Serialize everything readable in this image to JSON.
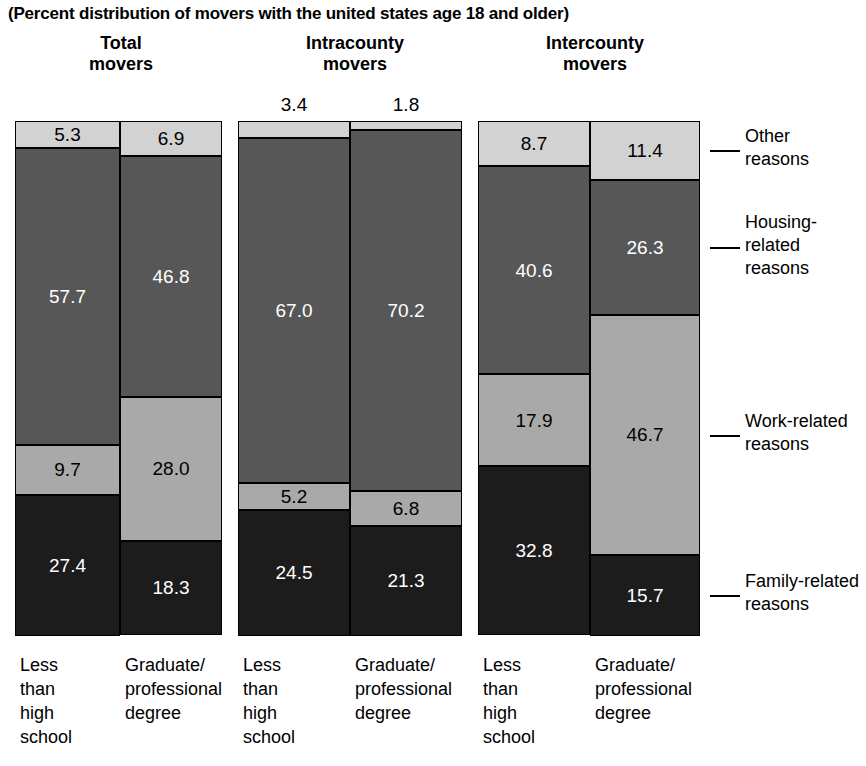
{
  "subtitle": "(Percent distribution of movers with the united states age 18 and older)",
  "groups": [
    {
      "title_line1": "Total",
      "title_line2": "movers",
      "bars": [
        {
          "category_lines": [
            "Less",
            "than",
            "high",
            "school"
          ],
          "values": {
            "other": 5.3,
            "housing": 57.7,
            "work": 9.7,
            "family": 27.4
          },
          "labels": {
            "other": "5.3",
            "housing": "57.7",
            "work": "9.7",
            "family": "27.4"
          },
          "outside_label": ""
        },
        {
          "category_lines": [
            "Graduate/",
            "professional",
            "degree"
          ],
          "values": {
            "other": 6.9,
            "housing": 46.8,
            "work": 28.0,
            "family": 18.3
          },
          "labels": {
            "other": "6.9",
            "housing": "46.8",
            "work": "28.0",
            "family": "18.3"
          },
          "outside_label": ""
        }
      ]
    },
    {
      "title_line1": "Intracounty",
      "title_line2": "movers",
      "bars": [
        {
          "category_lines": [
            "Less",
            "than",
            "high",
            "school"
          ],
          "values": {
            "other": 3.4,
            "housing": 67.0,
            "work": 5.2,
            "family": 24.5
          },
          "labels": {
            "other": "",
            "housing": "67.0",
            "work": "5.2",
            "family": "24.5"
          },
          "outside_label": "3.4"
        },
        {
          "category_lines": [
            "Graduate/",
            "professional",
            "degree"
          ],
          "values": {
            "other": 1.8,
            "housing": 70.2,
            "work": 6.8,
            "family": 21.3
          },
          "labels": {
            "other": "",
            "housing": "70.2",
            "work": "6.8",
            "family": "21.3"
          },
          "outside_label": "1.8"
        }
      ]
    },
    {
      "title_line1": "Intercounty",
      "title_line2": "movers",
      "bars": [
        {
          "category_lines": [
            "Less",
            "than",
            "high",
            "school"
          ],
          "values": {
            "other": 8.7,
            "housing": 40.6,
            "work": 17.9,
            "family": 32.8
          },
          "labels": {
            "other": "8.7",
            "housing": "40.6",
            "work": "17.9",
            "family": "32.8"
          },
          "outside_label": ""
        },
        {
          "category_lines": [
            "Graduate/",
            "professional",
            "degree"
          ],
          "values": {
            "other": 11.4,
            "housing": 26.3,
            "work": 46.7,
            "family": 15.7
          },
          "labels": {
            "other": "11.4",
            "housing": "26.3",
            "work": "46.7",
            "family": "15.7"
          },
          "outside_label": ""
        }
      ]
    }
  ],
  "legend": [
    {
      "lines": [
        "Other",
        "reasons"
      ],
      "key": "other",
      "color": "#d2d2d2"
    },
    {
      "lines": [
        "Housing-",
        "related",
        "reasons"
      ],
      "key": "housing",
      "color": "#575757"
    },
    {
      "lines": [
        "Work-related",
        "reasons"
      ],
      "key": "work",
      "color": "#a9a9a9"
    },
    {
      "lines": [
        "Family-related",
        "reasons"
      ],
      "key": "family",
      "color": "#1c1c1c"
    }
  ],
  "chart_data": {
    "type": "bar",
    "title": "",
    "subtitle": "(Percent distribution of movers with the united states age 18 and older)",
    "stacked": true,
    "orientation": "vertical",
    "xlabel": "",
    "ylabel": "",
    "ylim": [
      0,
      100
    ],
    "grid": false,
    "legend_position": "right",
    "categories": [
      "Total movers / Less than high school",
      "Total movers / Graduate-professional degree",
      "Intracounty movers / Less than high school",
      "Intracounty movers / Graduate-professional degree",
      "Intercounty movers / Less than high school",
      "Intercounty movers / Graduate-professional degree"
    ],
    "series": [
      {
        "name": "Other reasons",
        "values": [
          5.3,
          6.9,
          3.4,
          1.8,
          8.7,
          11.4
        ]
      },
      {
        "name": "Housing-related reasons",
        "values": [
          57.7,
          46.8,
          67.0,
          70.2,
          40.6,
          26.3
        ]
      },
      {
        "name": "Work-related reasons",
        "values": [
          9.7,
          28.0,
          5.2,
          6.8,
          17.9,
          46.7
        ]
      },
      {
        "name": "Family-related reasons",
        "values": [
          27.4,
          18.3,
          24.5,
          21.3,
          32.8,
          15.7
        ]
      }
    ],
    "annotations": [
      "3.4 shown above the Intracounty / Less than high school bar",
      "1.8 shown above the Intracounty / Graduate-professional degree bar"
    ]
  }
}
